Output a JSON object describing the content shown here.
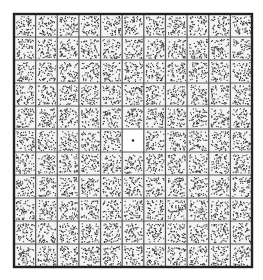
{
  "figure": {
    "rows": 11,
    "cols": 11,
    "blank_cell": {
      "row": 5,
      "col": 5
    },
    "has_fixation_dot": true,
    "colors": {
      "background": "#ffffff",
      "grid_line": "#555555",
      "border": "#222222",
      "dots": "#333333",
      "cell_fill": "#f4f4f4"
    },
    "dots_per_cell": 70
  }
}
